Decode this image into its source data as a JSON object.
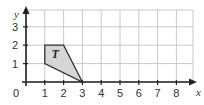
{
  "diagram": {
    "type": "coordinate-grid",
    "x_axis": {
      "label": "x",
      "min": 0,
      "max": 8,
      "ticks": [
        "1",
        "2",
        "3",
        "4",
        "5",
        "6",
        "7",
        "8"
      ]
    },
    "y_axis": {
      "label": "y",
      "min": 0,
      "max": 3,
      "ticks": [
        "1",
        "2",
        "3"
      ]
    },
    "origin_label": "0",
    "shapes": [
      {
        "label": "T",
        "vertices": [
          [
            1,
            1
          ],
          [
            1,
            2
          ],
          [
            2,
            2
          ],
          [
            3,
            0
          ]
        ],
        "fill": "#d6d6d6",
        "stroke": "#333333"
      }
    ]
  },
  "colors": {
    "grid": "#c8c8c8",
    "axis": "#222222",
    "shape_fill": "#d6d6d6",
    "shape_stroke": "#333333"
  }
}
